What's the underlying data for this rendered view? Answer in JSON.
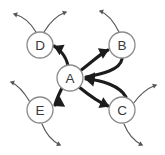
{
  "diagram": {
    "canvas": {
      "width": 165,
      "height": 155,
      "background": "#ffffff"
    },
    "style": {
      "node_fill": "#ffffff",
      "node_stroke": "#8c8c8c",
      "node_radius": 13,
      "label_color": "#3a3a3a",
      "internal_edge_color": "#1c1c1c",
      "external_edge_color": "#555555"
    },
    "nodes": [
      {
        "id": "A",
        "label": "A",
        "x": 70,
        "y": 78
      },
      {
        "id": "B",
        "label": "B",
        "x": 122,
        "y": 45
      },
      {
        "id": "C",
        "label": "C",
        "x": 122,
        "y": 110
      },
      {
        "id": "D",
        "label": "D",
        "x": 40,
        "y": 45
      },
      {
        "id": "E",
        "label": "E",
        "x": 40,
        "y": 110
      }
    ],
    "internal_edges": [
      {
        "id": "a-to-d",
        "from": "A",
        "to": "D",
        "directed": true,
        "path": "M 68 66 C 66 55 58 48 54 46",
        "head": {
          "x": 53.5,
          "y": 46,
          "angle": 205
        }
      },
      {
        "id": "a-to-b",
        "from": "A",
        "to": "B",
        "directed": true,
        "path": "M 80 71 C 92 62 100 54 108 50",
        "head": {
          "x": 109,
          "y": 49.5,
          "angle": -25
        }
      },
      {
        "id": "b-to-a",
        "from": "B",
        "to": "A",
        "directed": true,
        "path": "M 122 59 C 120 70 102 74 86 77",
        "head": {
          "x": 85,
          "y": 77.2,
          "angle": 185
        }
      },
      {
        "id": "c-to-a",
        "from": "C",
        "to": "A",
        "directed": true,
        "path": "M 126 97 C 120 86 102 80 86 79",
        "head": {
          "x": 85,
          "y": 79,
          "angle": 190
        }
      },
      {
        "id": "a-to-c",
        "from": "A",
        "to": "C",
        "directed": true,
        "path": "M 79 87 C 90 96 98 102 108 106",
        "head": {
          "x": 109.5,
          "y": 106.5,
          "angle": 24
        }
      },
      {
        "id": "a-to-e",
        "from": "A",
        "to": "E",
        "directed": true,
        "path": "M 62 88 C 58 96 56 101 55 105",
        "head": {
          "x": 54,
          "y": 106,
          "angle": 152
        }
      }
    ],
    "external_edges": [
      {
        "id": "d-out-upleft",
        "from": "D",
        "directed": true,
        "path": "M 36 32 C 30 22 22 16 14 14",
        "head": {
          "x": 13,
          "y": 13.8,
          "angle": 195
        }
      },
      {
        "id": "d-out-upright",
        "from": "D",
        "directed": true,
        "path": "M 44 32 C 50 22 58 15 66 12",
        "head": {
          "x": 67,
          "y": 11.7,
          "angle": -20
        }
      },
      {
        "id": "b-out-upleft",
        "from": "B",
        "directed": true,
        "path": "M 119 32 C 114 22 108 14 100 11",
        "head": {
          "x": 99,
          "y": 10.7,
          "angle": 197
        }
      },
      {
        "id": "c-out-upright",
        "from": "C",
        "directed": true,
        "path": "M 133 104 C 140 94 148 88 156 85",
        "head": {
          "x": 157,
          "y": 84.7,
          "angle": -20
        }
      },
      {
        "id": "c-out-downright",
        "from": "C",
        "directed": true,
        "path": "M 124 124 C 128 134 134 141 142 145",
        "head": {
          "x": 143,
          "y": 145.5,
          "angle": 27
        }
      },
      {
        "id": "e-out-upleft",
        "from": "E",
        "directed": true,
        "path": "M 30 102 C 24 92 18 85 11 82",
        "head": {
          "x": 10,
          "y": 81.7,
          "angle": 197
        }
      },
      {
        "id": "e-out-downright",
        "from": "E",
        "directed": true,
        "path": "M 42 124 C 46 134 52 141 60 145",
        "head": {
          "x": 61,
          "y": 145.5,
          "angle": 27
        }
      }
    ]
  }
}
